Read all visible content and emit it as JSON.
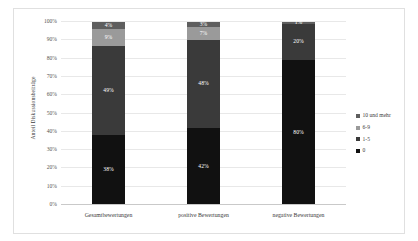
{
  "chart_data": {
    "type": "bar",
    "stacked": true,
    "normalized_percent": true,
    "title": "",
    "xlabel": "",
    "ylabel": "Anteil Diskussionsbeiträge",
    "ylim": [
      0,
      100
    ],
    "yticks": [
      "0%",
      "10%",
      "20%",
      "30%",
      "40%",
      "50%",
      "60%",
      "70%",
      "80%",
      "90%",
      "100%"
    ],
    "grid": true,
    "legend_position": "right",
    "categories": [
      "Gesamtbewertungen",
      "positive Bewertungen",
      "negative Bewertungen"
    ],
    "series": [
      {
        "name": "0",
        "color": "#111111",
        "values": [
          38,
          42,
          80
        ],
        "labels": [
          "38%",
          "42%",
          "80%"
        ]
      },
      {
        "name": "1-5",
        "color": "#3a3a3a",
        "values": [
          49,
          48,
          20
        ],
        "labels": [
          "49%",
          "48%",
          "20%"
        ]
      },
      {
        "name": "6-9",
        "color": "#9a9a9a",
        "values": [
          9,
          7,
          0
        ],
        "labels": [
          "9%",
          "7%",
          ""
        ]
      },
      {
        "name": "10 und mehr",
        "color": "#5e5e5e",
        "values": [
          4,
          3,
          1
        ],
        "labels": [
          "4%",
          "3%",
          "1%"
        ]
      }
    ],
    "legend_entries": [
      {
        "label": "10 und mehr",
        "color": "#5e5e5e"
      },
      {
        "label": "6-9",
        "color": "#9a9a9a"
      },
      {
        "label": "1-5",
        "color": "#3a3a3a"
      },
      {
        "label": "0",
        "color": "#111111"
      }
    ]
  }
}
